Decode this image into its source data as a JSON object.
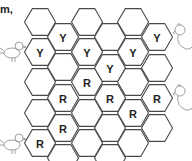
{
  "caption": "m,",
  "grid": {
    "hex_radius": 15.5,
    "columns": [
      {
        "cx": 40,
        "cells": [
          {
            "cy": 22,
            "label": ""
          },
          {
            "cy": 52,
            "label": "Y"
          },
          {
            "cy": 82,
            "label": ""
          },
          {
            "cy": 113,
            "label": ""
          },
          {
            "cy": 143,
            "label": "R"
          }
        ]
      },
      {
        "cx": 63,
        "cells": [
          {
            "cy": 37,
            "label": "Y"
          },
          {
            "cy": 67,
            "label": ""
          },
          {
            "cy": 98,
            "label": "R"
          },
          {
            "cy": 128,
            "label": "R"
          },
          {
            "cy": 158,
            "label": ""
          }
        ]
      },
      {
        "cx": 87,
        "cells": [
          {
            "cy": 22,
            "label": ""
          },
          {
            "cy": 52,
            "label": "Y"
          },
          {
            "cy": 82,
            "label": "R"
          },
          {
            "cy": 113,
            "label": ""
          },
          {
            "cy": 143,
            "label": ""
          }
        ]
      },
      {
        "cx": 110,
        "cells": [
          {
            "cy": 37,
            "label": ""
          },
          {
            "cy": 68,
            "label": "Y"
          },
          {
            "cy": 98,
            "label": "R"
          },
          {
            "cy": 128,
            "label": ""
          },
          {
            "cy": 158,
            "label": ""
          }
        ]
      },
      {
        "cx": 133,
        "cells": [
          {
            "cy": 22,
            "label": ""
          },
          {
            "cy": 52,
            "label": "Y"
          },
          {
            "cy": 82,
            "label": ""
          },
          {
            "cy": 113,
            "label": "R"
          },
          {
            "cy": 143,
            "label": ""
          }
        ]
      },
      {
        "cx": 157,
        "cells": [
          {
            "cy": 37,
            "label": "Y"
          },
          {
            "cy": 68,
            "label": ""
          },
          {
            "cy": 98,
            "label": "R"
          },
          {
            "cy": 128,
            "label": ""
          }
        ]
      }
    ]
  },
  "decorations": {
    "left_chicks": [
      {
        "x": 10,
        "y": 50
      },
      {
        "x": 10,
        "y": 142
      }
    ],
    "right_hens": [
      {
        "x": 180,
        "y": 34
      },
      {
        "x": 180,
        "y": 95
      }
    ]
  }
}
